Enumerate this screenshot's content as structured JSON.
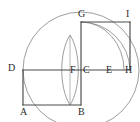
{
  "figure": {
    "type": "line-diagram",
    "background_color": "#ffffff",
    "segment_color": "#4a4a4a",
    "arc_color": "#8c8c8c",
    "label_color": "#2b2b2b"
  },
  "labels": [
    {
      "id": "A",
      "text": "A",
      "x": 20,
      "y": 107
    },
    {
      "id": "B",
      "text": "B",
      "x": 78,
      "y": 107
    },
    {
      "id": "C",
      "text": "C",
      "x": 83,
      "y": 65
    },
    {
      "id": "D",
      "text": "D",
      "x": 8,
      "y": 63
    },
    {
      "id": "E",
      "text": "E",
      "x": 106,
      "y": 65
    },
    {
      "id": "F",
      "text": "F",
      "x": 70,
      "y": 65
    },
    {
      "id": "G",
      "text": "G",
      "x": 78,
      "y": 9
    },
    {
      "id": "H",
      "text": "H",
      "x": 125,
      "y": 65
    },
    {
      "id": "I",
      "text": "I",
      "x": 126,
      "y": 9
    }
  ],
  "points": {
    "A": {
      "x": 23,
      "y": 105
    },
    "B": {
      "x": 81,
      "y": 105
    },
    "C": {
      "x": 81,
      "y": 70
    },
    "D": {
      "x": 23,
      "y": 70
    },
    "E": {
      "x": 110,
      "y": 70
    },
    "F": {
      "x": 70,
      "y": 70
    },
    "G": {
      "x": 81,
      "y": 22
    },
    "H": {
      "x": 130,
      "y": 70
    },
    "I": {
      "x": 130,
      "y": 22
    }
  },
  "segments": [
    {
      "name": "segment-AB",
      "from": "A",
      "to": "B"
    },
    {
      "name": "segment-AD",
      "from": "A",
      "to": "D"
    },
    {
      "name": "segment-DC",
      "from": "D",
      "to": "C"
    },
    {
      "name": "segment-CE",
      "from": "C",
      "to": "E"
    },
    {
      "name": "segment-EH",
      "from": "E",
      "to": "H"
    },
    {
      "name": "segment-BC",
      "from": "B",
      "to": "C"
    },
    {
      "name": "segment-CG",
      "from": "C",
      "to": "G"
    },
    {
      "name": "segment-GI",
      "from": "G",
      "to": "I"
    },
    {
      "name": "segment-IH",
      "from": "I",
      "to": "H"
    }
  ],
  "circles": [
    {
      "name": "large-circle",
      "center_x": 81,
      "center_y": 70,
      "radius": 58,
      "color": "#8c8c8c"
    }
  ],
  "arcs": [
    {
      "name": "arc-G-to-H",
      "description": "quarter arc from G down to H, centered near C",
      "path": "M 81 22 A 49 49 0 0 1 130 70"
    },
    {
      "name": "arc-G-to-E",
      "description": "quarter arc from G down to E, centered near C",
      "path": "M 81 22 A 48 48 0 0 1 129 70"
    }
  ],
  "lens": {
    "name": "vesica-lens",
    "center_x": 70,
    "top_y": 35,
    "bottom_y": 105,
    "half_width": 11,
    "axis": "vertical line from lens top to lens bottom"
  }
}
